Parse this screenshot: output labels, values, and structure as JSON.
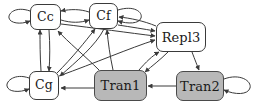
{
  "figure": {
    "type": "directed-graph",
    "background_color": "#ffffff",
    "edge_color": "#3a3a3a",
    "node_border_color": "#3a3a3a",
    "node_fill_plain": "#ffffff",
    "node_fill_shaded": "#b8b8b8"
  },
  "nodes": [
    {
      "id": "Cc",
      "label": "Cc",
      "style": "plain",
      "x": 30,
      "y": 4,
      "w": 31,
      "h": 26,
      "font_size": 12.5
    },
    {
      "id": "Cf",
      "label": "Cf",
      "style": "plain",
      "x": 89,
      "y": 3,
      "w": 29,
      "h": 26,
      "font_size": 12.5
    },
    {
      "id": "Repl3",
      "label": "Repl3",
      "style": "plain",
      "x": 156,
      "y": 22,
      "w": 50,
      "h": 30,
      "font_size": 13
    },
    {
      "id": "Cg",
      "label": "Cg",
      "style": "plain",
      "x": 29,
      "y": 71,
      "w": 30,
      "h": 29,
      "font_size": 12.5
    },
    {
      "id": "Tran1",
      "label": "Tran1",
      "style": "shaded",
      "x": 94,
      "y": 70,
      "w": 53,
      "h": 31,
      "font_size": 13
    },
    {
      "id": "Tran2",
      "label": "Tran2",
      "style": "shaded",
      "x": 176,
      "y": 71,
      "w": 48,
      "h": 30,
      "font_size": 13
    }
  ],
  "self_loops": [
    {
      "node": "Cc",
      "side": "left"
    },
    {
      "node": "Cf",
      "side": "right"
    },
    {
      "node": "Cg",
      "side": "left"
    },
    {
      "node": "Tran2",
      "side": "right"
    }
  ],
  "edges": [
    {
      "from": "Cf",
      "to": "Cc"
    },
    {
      "from": "Cc",
      "to": "Cf"
    },
    {
      "from": "Cg",
      "to": "Cc"
    },
    {
      "from": "Cc",
      "to": "Cg"
    },
    {
      "from": "Cg",
      "to": "Cf"
    },
    {
      "from": "Cf",
      "to": "Cg"
    },
    {
      "from": "Tran1",
      "to": "Cc"
    },
    {
      "from": "Tran1",
      "to": "Cf"
    },
    {
      "from": "Tran1",
      "to": "Cg"
    },
    {
      "from": "Tran1",
      "to": "Repl3"
    },
    {
      "from": "Repl3",
      "to": "Tran1"
    },
    {
      "from": "Cc",
      "to": "Repl3"
    },
    {
      "from": "Cf",
      "to": "Repl3"
    },
    {
      "from": "Cg",
      "to": "Repl3"
    },
    {
      "from": "Repl3",
      "to": "Cf"
    },
    {
      "from": "Tran2",
      "to": "Tran1"
    },
    {
      "from": "Repl3",
      "to": "Tran2"
    }
  ]
}
